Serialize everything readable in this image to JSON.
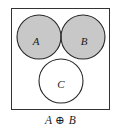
{
  "figure": {
    "type": "venn-diagram",
    "caption": "A ⊕ B",
    "universe": {
      "name": "universal-set-rectangle",
      "x": 11,
      "y": 8,
      "width": 99,
      "height": 102,
      "stroke": "#333333",
      "fill": "#ffffff"
    },
    "colors": {
      "shaded": "#c8c8c8",
      "unshaded": "#ffffff",
      "stroke": "#262626",
      "text": "#1a1a1a"
    },
    "circles": [
      {
        "label": "A",
        "cx": 39,
        "cy": 37,
        "r": 22,
        "label_x": 36,
        "label_y": 45,
        "shaded": true
      },
      {
        "label": "B",
        "cx": 83,
        "cy": 37,
        "r": 22,
        "label_x": 84,
        "label_y": 45,
        "shaded": true
      },
      {
        "label": "C",
        "cx": 61,
        "cy": 81,
        "r": 22,
        "label_x": 61,
        "label_y": 88,
        "shaded": false
      }
    ],
    "shading_rule": "symmetric difference of A and B: (A ∪ B) \\ (A ∩ B)",
    "regions": [
      {
        "name": "A-only",
        "shaded": true
      },
      {
        "name": "B-only",
        "shaded": true
      },
      {
        "name": "A-and-C-not-B",
        "shaded": true
      },
      {
        "name": "B-and-C-not-A",
        "shaded": true
      },
      {
        "name": "A-and-B-not-C",
        "shaded": false
      },
      {
        "name": "A-and-B-and-C",
        "shaded": false
      },
      {
        "name": "C-only",
        "shaded": false
      },
      {
        "name": "outside-all-circles",
        "shaded": false
      }
    ]
  }
}
